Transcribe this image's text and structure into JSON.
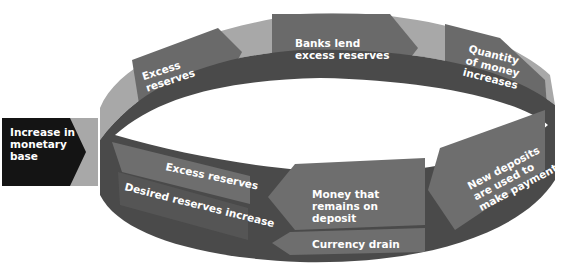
{
  "diagram": {
    "start_node": {
      "lines": [
        "Increase in",
        "monetary",
        "base"
      ]
    },
    "top_loop": [
      {
        "id": "excess-reserves-top",
        "lines": [
          "Excess",
          "reserves"
        ]
      },
      {
        "id": "banks-lend",
        "lines": [
          "Banks lend",
          "excess reserves"
        ]
      },
      {
        "id": "quantity-of-money",
        "lines": [
          "Quantity",
          "of money",
          "increases"
        ]
      }
    ],
    "bottom_loop": [
      {
        "id": "new-deposits",
        "lines": [
          "New deposits",
          "are used to",
          "make payments"
        ]
      },
      {
        "id": "money-remains",
        "lines": [
          "Money that",
          "remains on",
          "deposit"
        ]
      },
      {
        "id": "currency-drain",
        "lines": [
          "Currency drain"
        ]
      },
      {
        "id": "excess-reserves-bottom",
        "lines": [
          "Excess reserves"
        ]
      },
      {
        "id": "desired-reserves",
        "lines": [
          "Desired reserves increase"
        ]
      }
    ],
    "colors": {
      "band_light": "#a8a8a8",
      "band_mid": "#6e6e6e",
      "band_dark": "#4a4a4a",
      "arrow": "#5c5c5c",
      "start_node": "#141414",
      "text": "#ffffff"
    }
  }
}
